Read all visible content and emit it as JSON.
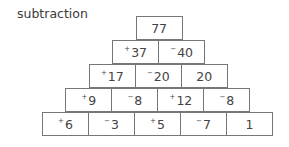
{
  "title": "subtraction",
  "pyramid": {
    "rows": [
      [
        {
          "sign": "",
          "value": "77"
        }
      ],
      [
        {
          "sign": "+",
          "value": "37"
        },
        {
          "sign": "−",
          "value": "40"
        }
      ],
      [
        {
          "sign": "+",
          "value": "17"
        },
        {
          "sign": "−",
          "value": "20"
        },
        {
          "sign": "",
          "value": "20"
        }
      ],
      [
        {
          "sign": "+",
          "value": "9"
        },
        {
          "sign": "−",
          "value": "8"
        },
        {
          "sign": "+",
          "value": "12"
        },
        {
          "sign": "−",
          "value": "8"
        }
      ],
      [
        {
          "sign": "+",
          "value": "6"
        },
        {
          "sign": "−",
          "value": "3"
        },
        {
          "sign": "+",
          "value": "5"
        },
        {
          "sign": "−",
          "value": "7"
        },
        {
          "sign": "",
          "value": "1"
        }
      ]
    ]
  }
}
